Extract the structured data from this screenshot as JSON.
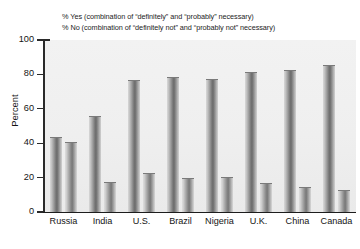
{
  "chart_data": {
    "type": "bar",
    "title": "",
    "xlabel": "",
    "ylabel": "Percent",
    "ylim": [
      0,
      100
    ],
    "yticks": [
      0,
      20,
      40,
      60,
      80,
      100
    ],
    "grid": false,
    "legend_position": "top",
    "categories": [
      "Russia",
      "India",
      "U.S.",
      "Brazil",
      "Nigeria",
      "U.K.",
      "China",
      "Canada"
    ],
    "series": [
      {
        "name": "% Yes (combination of “definitely” and “probably” necessary)",
        "values": [
          43,
          55,
          76,
          78,
          77,
          81,
          82,
          85
        ]
      },
      {
        "name": "% No (combination of “definitely not” and “probably not” necessary)",
        "values": [
          40,
          17,
          22,
          19,
          20,
          16,
          14,
          12
        ]
      }
    ]
  },
  "legend": {
    "line1": "% Yes (combination of “definitely” and “probably” necessary)",
    "line2": "% No (combination of “definitely not” and “probably not” necessary)"
  },
  "axis": {
    "y_label": "Percent",
    "y_ticks": [
      "100",
      "80",
      "60",
      "40",
      "20",
      "0"
    ]
  },
  "colors": {
    "bar_dark": "#6a6a6a",
    "bar_light": "#d8d8d8",
    "axis": "#1d1d1d",
    "plot_background": "#efefef",
    "text": "#141414"
  }
}
